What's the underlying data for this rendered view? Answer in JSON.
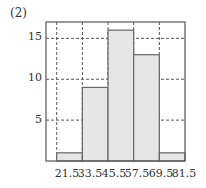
{
  "figure": {
    "label": "(2)"
  },
  "chart_data": {
    "type": "bar",
    "title": "",
    "xlabel": "",
    "ylabel": "",
    "bin_edges": [
      21.5,
      33.5,
      45.5,
      57.5,
      69.5,
      81.5
    ],
    "categories": [
      "21.5-33.5",
      "33.5-45.5",
      "45.5-57.5",
      "57.5-69.5",
      "69.5-81.5"
    ],
    "values": [
      1,
      9,
      16,
      13,
      1
    ],
    "x_tick_labels": [
      "21.5",
      "33.5",
      "45.5",
      "57.5",
      "69.5",
      "81.5"
    ],
    "y_tick_labels": [
      "5",
      "10",
      "15"
    ],
    "y_ticks": [
      5,
      10,
      15
    ],
    "ylim": [
      0,
      17
    ],
    "xlim": [
      16.5,
      81.5
    ],
    "grid": true,
    "grid_style": "dashed",
    "bar_fill": "#e6e6e6",
    "bar_edge": "#666666",
    "legend": null
  }
}
